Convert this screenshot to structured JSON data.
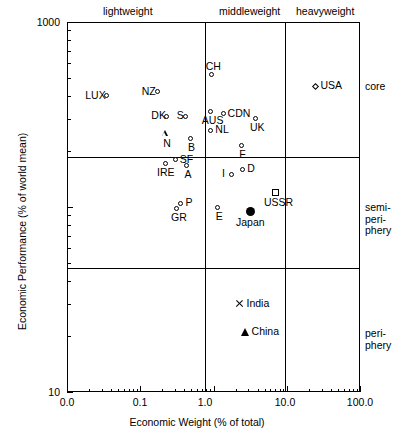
{
  "chart_data": {
    "type": "scatter",
    "title": "",
    "xlabel": "Economic Weight (% of total)",
    "ylabel": "Economic Performance (% of world mean)",
    "xscale": "log",
    "yscale": "log",
    "xlim": [
      0.01,
      100.0
    ],
    "ylim": [
      10,
      1000
    ],
    "xticks": [
      "0.0",
      "0.1",
      "1.0",
      "10.0",
      "100.0"
    ],
    "yticks": [
      "1000",
      "10"
    ],
    "grid": false,
    "legend": "none",
    "column_bands": [
      {
        "label": "lightweight",
        "x_range": [
          0.01,
          1.0
        ]
      },
      {
        "label": "middleweight",
        "x_range": [
          1.0,
          10.0
        ]
      },
      {
        "label": "heavyweight",
        "x_range": [
          10.0,
          100.0
        ]
      }
    ],
    "row_bands": [
      {
        "label": "core",
        "y_range": [
          180,
          1000
        ]
      },
      {
        "label": "semi-periphery",
        "y_range": [
          52,
          180
        ]
      },
      {
        "label": "periphery",
        "y_range": [
          10,
          52
        ]
      }
    ],
    "points": [
      {
        "label": "LUX",
        "x": 0.035,
        "y": 400,
        "marker": "circle",
        "label_pos": "left"
      },
      {
        "label": "NZ",
        "x": 0.17,
        "y": 420,
        "marker": "circle",
        "label_pos": "left"
      },
      {
        "label": "CH",
        "x": 0.95,
        "y": 520,
        "marker": "circle",
        "label_pos": "above"
      },
      {
        "label": "USA",
        "x": 25.0,
        "y": 450,
        "marker": "diamond",
        "label_pos": "right"
      },
      {
        "label": "DK",
        "x": 0.23,
        "y": 310,
        "marker": "circle",
        "label_pos": "left"
      },
      {
        "label": "S",
        "x": 0.42,
        "y": 310,
        "marker": "circle",
        "label_pos": "left"
      },
      {
        "label": "AUS",
        "x": 0.9,
        "y": 330,
        "marker": "circle",
        "label_pos": "below"
      },
      {
        "label": "CDN",
        "x": 1.35,
        "y": 320,
        "marker": "circle",
        "label_pos": "right"
      },
      {
        "label": "UK",
        "x": 3.7,
        "y": 300,
        "marker": "circle",
        "label_pos": "below"
      },
      {
        "label": "N",
        "x": 0.22,
        "y": 250,
        "marker": "triangle-open",
        "label_pos": "below"
      },
      {
        "label": "B",
        "x": 0.48,
        "y": 235,
        "marker": "circle",
        "label_pos": "below"
      },
      {
        "label": "NL",
        "x": 0.92,
        "y": 260,
        "marker": "circle",
        "label_pos": "right"
      },
      {
        "label": "F",
        "x": 2.4,
        "y": 215,
        "marker": "circle",
        "label_pos": "below"
      },
      {
        "label": "SF",
        "x": 0.3,
        "y": 180,
        "marker": "circle",
        "label_pos": "right"
      },
      {
        "label": "IRE",
        "x": 0.22,
        "y": 172,
        "marker": "circle",
        "label_pos": "below"
      },
      {
        "label": "A",
        "x": 0.43,
        "y": 168,
        "marker": "circle",
        "label_pos": "below"
      },
      {
        "label": "D",
        "x": 2.5,
        "y": 160,
        "marker": "circle",
        "label_pos": "right"
      },
      {
        "label": "I",
        "x": 1.75,
        "y": 150,
        "marker": "circle",
        "label_pos": "left"
      },
      {
        "label": "USSR",
        "x": 7.0,
        "y": 120,
        "marker": "square",
        "label_pos": "below"
      },
      {
        "label": "P",
        "x": 0.36,
        "y": 105,
        "marker": "circle",
        "label_pos": "right"
      },
      {
        "label": "GR",
        "x": 0.31,
        "y": 98,
        "marker": "circle",
        "label_pos": "below"
      },
      {
        "label": "E",
        "x": 1.15,
        "y": 100,
        "marker": "circle",
        "label_pos": "below"
      },
      {
        "label": "Japan",
        "x": 3.2,
        "y": 95,
        "marker": "dot",
        "label_pos": "below"
      },
      {
        "label": "India",
        "x": 2.3,
        "y": 30,
        "marker": "x",
        "label_pos": "right"
      },
      {
        "label": "China",
        "x": 2.7,
        "y": 21,
        "marker": "triangle-filled",
        "label_pos": "right"
      }
    ]
  },
  "axes": {
    "x_label": "Economic Weight (% of total)",
    "y_label": "Economic Performance (% of world mean)",
    "x_ticks": [
      "0.0",
      "0.1",
      "1.0",
      "10.0",
      "100.0"
    ],
    "y_top": "1000",
    "y_bottom": "10"
  },
  "bands": {
    "top": [
      "lightweight",
      "middleweight",
      "heavyweight"
    ],
    "right": [
      "core",
      "semi-periphery",
      "periphery"
    ]
  }
}
